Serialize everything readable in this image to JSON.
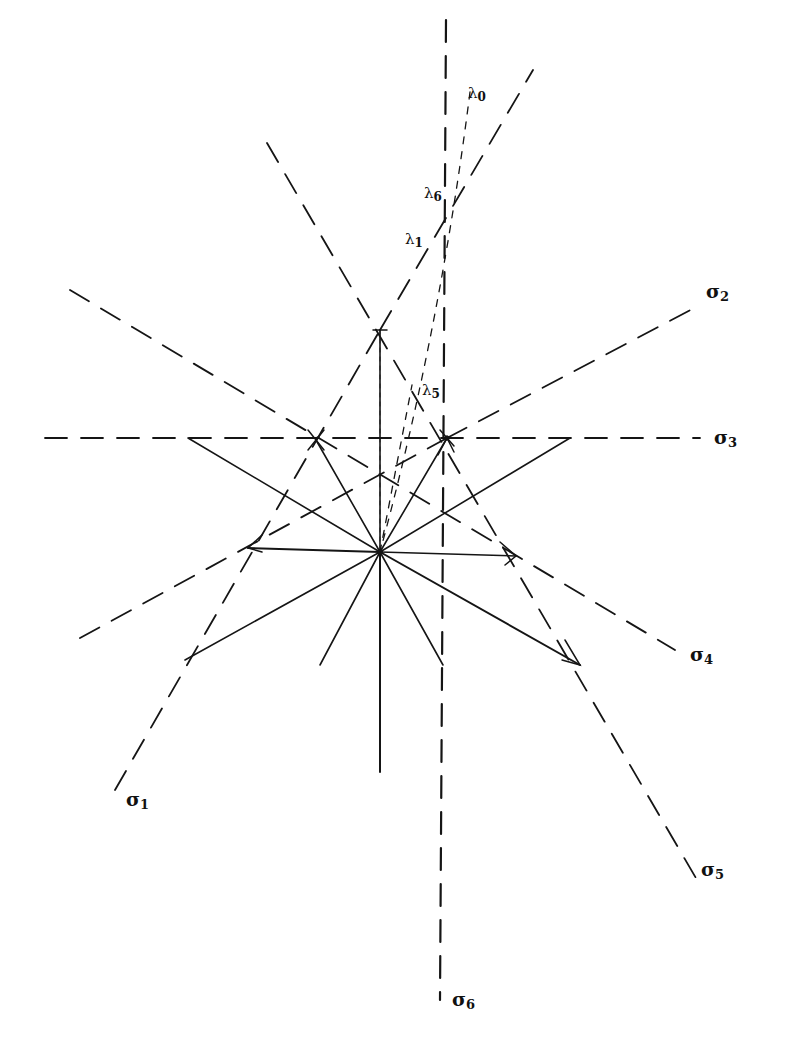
{
  "diagram": {
    "type": "geometric construction",
    "center": {
      "name": "O",
      "x": 380,
      "y": 552
    },
    "labels": {
      "sigma_1": {
        "base": "σ",
        "sub": "1"
      },
      "sigma_2": {
        "base": "σ",
        "sub": "2"
      },
      "sigma_3": {
        "base": "σ",
        "sub": "3"
      },
      "sigma_4": {
        "base": "σ",
        "sub": "4"
      },
      "sigma_5": {
        "base": "σ",
        "sub": "5"
      },
      "sigma_6": {
        "base": "σ",
        "sub": "6"
      },
      "lambda_0": {
        "base": "λ",
        "sub": "0"
      },
      "lambda_1": {
        "base": "λ",
        "sub": "1"
      },
      "lambda_5": {
        "base": "λ",
        "sub": "5"
      },
      "lambda_6": {
        "base": "λ",
        "sub": "6"
      }
    },
    "solid_rays_from_center": [
      {
        "to": [
          380,
          330
        ]
      },
      {
        "to": [
          447,
          438
        ]
      },
      {
        "to": [
          570,
          438
        ]
      },
      {
        "to": [
          516,
          556
        ]
      },
      {
        "to": [
          580,
          665
        ]
      },
      {
        "to": [
          443,
          665
        ]
      },
      {
        "to": [
          380,
          772
        ]
      },
      {
        "to": [
          320,
          665
        ]
      },
      {
        "to": [
          185,
          660
        ]
      },
      {
        "to": [
          248,
          548
        ]
      },
      {
        "to": [
          188,
          438
        ]
      },
      {
        "to": [
          316,
          440
        ]
      }
    ],
    "dashed_lines": [
      {
        "name": "sigma_1_line",
        "from": [
          115,
          790
        ],
        "to": [
          380,
          330
        ]
      },
      {
        "name": "sigma_2_line",
        "from": [
          447,
          438
        ],
        "to": [
          700,
          305
        ]
      },
      {
        "name": "sigma_3_line",
        "from": [
          45,
          438
        ],
        "to": [
          700,
          438
        ]
      },
      {
        "name": "sigma_4_line",
        "from": [
          70,
          290
        ],
        "to": [
          675,
          650
        ]
      },
      {
        "name": "sigma_5_line",
        "from": [
          267,
          143
        ],
        "to": [
          700,
          885
        ]
      },
      {
        "name": "sigma_6_line",
        "from": [
          446,
          20
        ],
        "to": [
          440,
          1000
        ]
      },
      {
        "name": "line_to_lower_left",
        "from": [
          80,
          638
        ],
        "to": [
          447,
          438
        ]
      },
      {
        "name": "lambda_1_line",
        "from": [
          380,
          330
        ],
        "to": [
          533,
          70
        ]
      }
    ],
    "fine_dashed_lines": [
      {
        "name": "lambda_0_curve",
        "points": [
          [
            470,
            90
          ],
          [
            455,
            230
          ],
          [
            420,
            390
          ],
          [
            380,
            552
          ]
        ]
      },
      {
        "name": "lambda_5_line",
        "from": [
          380,
          552
        ],
        "to": [
          410,
          380
        ]
      }
    ]
  }
}
